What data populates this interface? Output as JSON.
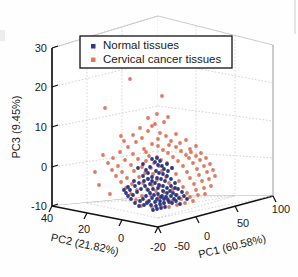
{
  "figure": {
    "type": "scatter3d",
    "background": "#ffffff"
  },
  "legend": {
    "position": "top-center",
    "border_color": "#111111",
    "background": "#ffffff",
    "entries": [
      {
        "label": "Normal tissues",
        "color": "#2c3a85",
        "marker": "square"
      },
      {
        "label": "Cervical cancer tissues",
        "color": "#e07a5f",
        "marker": "square"
      }
    ]
  },
  "axes": {
    "x": {
      "title": "PC1 (60.58%)",
      "ticks": [
        "-50",
        "0",
        "50",
        "100"
      ],
      "range": [
        -50,
        100
      ]
    },
    "y": {
      "title": "PC2 (21.82%)",
      "ticks": [
        "40",
        "20",
        "0",
        "-20"
      ],
      "range": [
        -20,
        40
      ]
    },
    "z": {
      "title": "PC3 (9.45%)",
      "ticks": [
        "30",
        "20",
        "10",
        "0",
        "-10"
      ],
      "range": [
        -10,
        30
      ]
    }
  },
  "chart_data": {
    "type": "scatter",
    "title": "",
    "xlabel": "PC1 (60.58%)",
    "ylabel": "PC2 (21.82%)",
    "zlabel": "PC3 (9.45%)",
    "xlim": [
      -50,
      100
    ],
    "ylim": [
      -20,
      40
    ],
    "zlim": [
      -10,
      30
    ],
    "grid": true,
    "legend_position": "top-center",
    "series": [
      {
        "name": "Normal tissues",
        "color": "#2c3a85",
        "points_px": [
          [
            152,
            198
          ],
          [
            157,
            199
          ],
          [
            161,
            197
          ],
          [
            149,
            201
          ],
          [
            155,
            202
          ],
          [
            160,
            201
          ],
          [
            164,
            199
          ],
          [
            146,
            196
          ],
          [
            150,
            193
          ],
          [
            154,
            195
          ],
          [
            158,
            194
          ],
          [
            162,
            196
          ],
          [
            166,
            197
          ],
          [
            168,
            200
          ],
          [
            143,
            199
          ],
          [
            147,
            203
          ],
          [
            151,
            205
          ],
          [
            156,
            206
          ],
          [
            160,
            204
          ],
          [
            164,
            203
          ],
          [
            169,
            202
          ],
          [
            148,
            190
          ],
          [
            153,
            189
          ],
          [
            158,
            188
          ],
          [
            163,
            191
          ],
          [
            167,
            193
          ],
          [
            171,
            196
          ],
          [
            174,
            199
          ],
          [
            140,
            201
          ],
          [
            144,
            205
          ],
          [
            139,
            206
          ],
          [
            135,
            203
          ],
          [
            131,
            199
          ],
          [
            128,
            196
          ],
          [
            150,
            184
          ],
          [
            155,
            183
          ],
          [
            159,
            185
          ],
          [
            163,
            186
          ],
          [
            167,
            188
          ],
          [
            145,
            186
          ],
          [
            141,
            189
          ],
          [
            137,
            192
          ],
          [
            133,
            195
          ],
          [
            157,
            178
          ],
          [
            161,
            179
          ],
          [
            165,
            181
          ],
          [
            152,
            177
          ],
          [
            170,
            191
          ],
          [
            173,
            193
          ],
          [
            176,
            195
          ],
          [
            179,
            198
          ],
          [
            159,
            173
          ],
          [
            163,
            174
          ],
          [
            156,
            171
          ],
          [
            167,
            176
          ],
          [
            171,
            179
          ],
          [
            175,
            183
          ],
          [
            144,
            181
          ],
          [
            148,
            179
          ],
          [
            152,
            181
          ],
          [
            161,
            208
          ],
          [
            165,
            207
          ],
          [
            157,
            209
          ],
          [
            153,
            210
          ],
          [
            172,
            203
          ],
          [
            176,
            201
          ],
          [
            180,
            204
          ],
          [
            135,
            186
          ],
          [
            130,
            190
          ],
          [
            126,
            193
          ],
          [
            148,
            173
          ],
          [
            143,
            176
          ],
          [
            168,
            171
          ],
          [
            164,
            169
          ],
          [
            178,
            189
          ],
          [
            182,
            192
          ],
          [
            158,
            165
          ],
          [
            162,
            166
          ],
          [
            139,
            183
          ],
          [
            134,
            181
          ],
          [
            171,
            186
          ],
          [
            175,
            188
          ],
          [
            150,
            167
          ],
          [
            146,
            170
          ],
          [
            184,
            196
          ],
          [
            187,
            199
          ],
          [
            155,
            162
          ],
          [
            160,
            161
          ],
          [
            167,
            164
          ],
          [
            172,
            168
          ],
          [
            128,
            187
          ],
          [
            124,
            190
          ],
          [
            143,
            164
          ],
          [
            138,
            168
          ],
          [
            152,
            159
          ],
          [
            157,
            158
          ]
        ]
      },
      {
        "name": "Cervical cancer tissues",
        "color": "#e07a5f",
        "points_px": [
          [
            130,
            79
          ],
          [
            162,
            96
          ],
          [
            105,
            108
          ],
          [
            155,
            124
          ],
          [
            148,
            131
          ],
          [
            160,
            133
          ],
          [
            142,
            138
          ],
          [
            166,
            136
          ],
          [
            136,
            142
          ],
          [
            152,
            144
          ],
          [
            158,
            146
          ],
          [
            171,
            141
          ],
          [
            128,
            147
          ],
          [
            144,
            149
          ],
          [
            163,
            150
          ],
          [
            176,
            147
          ],
          [
            120,
            152
          ],
          [
            133,
            154
          ],
          [
            149,
            156
          ],
          [
            157,
            157
          ],
          [
            168,
            153
          ],
          [
            181,
            151
          ],
          [
            113,
            158
          ],
          [
            125,
            160
          ],
          [
            138,
            159
          ],
          [
            146,
            161
          ],
          [
            154,
            163
          ],
          [
            161,
            160
          ],
          [
            173,
            157
          ],
          [
            186,
            155
          ],
          [
            191,
            152
          ],
          [
            108,
            163
          ],
          [
            118,
            166
          ],
          [
            131,
            165
          ],
          [
            142,
            167
          ],
          [
            151,
            168
          ],
          [
            159,
            166
          ],
          [
            167,
            163
          ],
          [
            178,
            161
          ],
          [
            189,
            158
          ],
          [
            196,
            156
          ],
          [
            201,
            153
          ],
          [
            112,
            170
          ],
          [
            122,
            172
          ],
          [
            134,
            171
          ],
          [
            145,
            173
          ],
          [
            153,
            174
          ],
          [
            162,
            171
          ],
          [
            172,
            168
          ],
          [
            183,
            166
          ],
          [
            193,
            163
          ],
          [
            200,
            160
          ],
          [
            206,
            158
          ],
          [
            116,
            176
          ],
          [
            127,
            178
          ],
          [
            139,
            177
          ],
          [
            148,
            179
          ],
          [
            157,
            180
          ],
          [
            166,
            177
          ],
          [
            176,
            174
          ],
          [
            187,
            172
          ],
          [
            197,
            169
          ],
          [
            204,
            166
          ],
          [
            210,
            164
          ],
          [
            121,
            182
          ],
          [
            132,
            184
          ],
          [
            143,
            183
          ],
          [
            152,
            185
          ],
          [
            160,
            186
          ],
          [
            169,
            183
          ],
          [
            179,
            181
          ],
          [
            190,
            178
          ],
          [
            199,
            175
          ],
          [
            207,
            172
          ],
          [
            213,
            170
          ],
          [
            126,
            188
          ],
          [
            137,
            190
          ],
          [
            147,
            189
          ],
          [
            156,
            191
          ],
          [
            164,
            192
          ],
          [
            173,
            189
          ],
          [
            183,
            187
          ],
          [
            194,
            184
          ],
          [
            202,
            181
          ],
          [
            209,
            179
          ],
          [
            131,
            194
          ],
          [
            142,
            196
          ],
          [
            151,
            195
          ],
          [
            159,
            197
          ],
          [
            167,
            198
          ],
          [
            177,
            195
          ],
          [
            187,
            193
          ],
          [
            196,
            190
          ],
          [
            204,
            188
          ],
          [
            136,
            200
          ],
          [
            147,
            202
          ],
          [
            156,
            201
          ],
          [
            164,
            203
          ],
          [
            172,
            201
          ],
          [
            181,
            199
          ],
          [
            190,
            197
          ],
          [
            198,
            195
          ],
          [
            141,
            206
          ],
          [
            152,
            207
          ],
          [
            161,
            206
          ],
          [
            169,
            207
          ],
          [
            177,
            205
          ],
          [
            185,
            203
          ],
          [
            193,
            201
          ],
          [
            95,
            172
          ],
          [
            99,
            185
          ],
          [
            103,
            155
          ],
          [
            110,
            194
          ],
          [
            215,
            176
          ],
          [
            211,
            186
          ],
          [
            205,
            194
          ],
          [
            146,
            152
          ],
          [
            169,
            145
          ],
          [
            180,
            143
          ],
          [
            124,
            141
          ],
          [
            158,
            139
          ],
          [
            190,
            149
          ],
          [
            196,
            146
          ],
          [
            140,
            128
          ],
          [
            152,
            126
          ],
          [
            164,
            122
          ],
          [
            176,
            134
          ],
          [
            133,
            135
          ],
          [
            121,
            136
          ],
          [
            186,
            140
          ],
          [
            148,
            118
          ],
          [
            157,
            114
          ],
          [
            168,
            117
          ]
        ]
      }
    ]
  }
}
